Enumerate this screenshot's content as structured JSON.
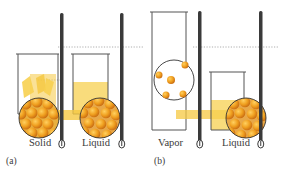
{
  "figure": {
    "panels": [
      {
        "id": "a",
        "tag": "(a)",
        "containers": [
          {
            "label": "Solid",
            "state": "solid"
          },
          {
            "label": "Liquid",
            "state": "liquid"
          }
        ]
      },
      {
        "id": "b",
        "tag": "(b)",
        "containers": [
          {
            "label": "Vapor",
            "state": "vapor"
          },
          {
            "label": "Liquid",
            "state": "liquid"
          }
        ]
      }
    ],
    "colors": {
      "particle": "#f0a020",
      "particle_dark": "#c86a10",
      "liquid": "#f7d050",
      "solid": "#f5c842",
      "thermometer": "#3a3a3a",
      "beaker_outline": "#555555",
      "dotted_line": "#999999"
    }
  }
}
